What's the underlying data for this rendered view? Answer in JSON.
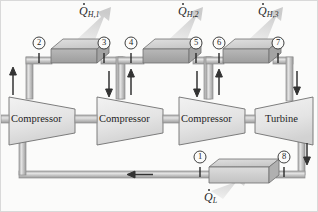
{
  "figure": {
    "background_color": "#fbfbfa",
    "pipe_color": "#b9b9b9",
    "pipe_edge_color": "#8f8f8f",
    "component_fill": "#e9e9e9",
    "component_edge": "#6f6f6f",
    "exchanger_fill": "#b3b3b3",
    "arrow_color": "#3a3a3a",
    "heat_plume_color": "#dcdcdc"
  },
  "heat_labels": [
    {
      "id": "qh1",
      "symbol": "Q",
      "sub": "H,1",
      "dotted": true,
      "x": 78,
      "y": 4
    },
    {
      "id": "qh2",
      "symbol": "Q",
      "sub": "H,2",
      "dotted": true,
      "x": 177,
      "y": 4
    },
    {
      "id": "qh3",
      "symbol": "Q",
      "sub": "H,3",
      "dotted": true,
      "x": 257,
      "y": 4
    },
    {
      "id": "ql",
      "symbol": "Q",
      "sub": "L",
      "dotted": true,
      "x": 203,
      "y": 190
    }
  ],
  "components": [
    {
      "id": "compressor-1",
      "label": "Compressor",
      "type": "compressor",
      "x": 6,
      "y": 94,
      "w": 72,
      "h": 48
    },
    {
      "id": "compressor-2",
      "label": "Compressor",
      "type": "compressor",
      "x": 94,
      "y": 94,
      "w": 72,
      "h": 48
    },
    {
      "id": "compressor-3",
      "label": "Compressor",
      "type": "compressor",
      "x": 176,
      "y": 94,
      "w": 72,
      "h": 48
    },
    {
      "id": "turbine-1",
      "label": "Turbine",
      "type": "turbine",
      "x": 252,
      "y": 94,
      "w": 62,
      "h": 48
    }
  ],
  "heat_exchangers": [
    {
      "id": "intercooler-1",
      "x": 44,
      "y": 38,
      "w": 62,
      "h": 22,
      "direction": "out"
    },
    {
      "id": "intercooler-2",
      "x": 136,
      "y": 38,
      "w": 62,
      "h": 22,
      "direction": "out"
    },
    {
      "id": "aftercooler-3",
      "x": 216,
      "y": 38,
      "w": 62,
      "h": 22,
      "direction": "out"
    },
    {
      "id": "refrigerated-space-heat-exchanger",
      "x": 206,
      "y": 158,
      "w": 72,
      "h": 20,
      "direction": "in"
    }
  ],
  "state_points": [
    {
      "id": "state-2",
      "number": "2",
      "x": 44,
      "y": 32
    },
    {
      "id": "state-3",
      "number": "3",
      "x": 100,
      "y": 32
    },
    {
      "id": "state-4",
      "number": "4",
      "x": 136,
      "y": 32
    },
    {
      "id": "state-5",
      "number": "5",
      "x": 192,
      "y": 32
    },
    {
      "id": "state-6",
      "number": "6",
      "x": 215,
      "y": 32
    },
    {
      "id": "state-7",
      "number": "7",
      "x": 272,
      "y": 32
    },
    {
      "id": "state-1",
      "number": "1",
      "x": 193,
      "y": 150
    },
    {
      "id": "state-8",
      "number": "8",
      "x": 280,
      "y": 150
    }
  ],
  "flow_arrows": [
    {
      "id": "flow-up-left-riser",
      "direction": "up",
      "x": 28,
      "y": 74
    },
    {
      "id": "flow-down-to-compressor-2",
      "direction": "down",
      "x": 120,
      "y": 74
    },
    {
      "id": "flow-up-to-exchanger-2",
      "direction": "up",
      "x": 122,
      "y": 74
    },
    {
      "id": "flow-down-to-compressor-3",
      "direction": "down",
      "x": 208,
      "y": 74
    },
    {
      "id": "flow-up-to-exchanger-3",
      "direction": "up",
      "x": 210,
      "y": 74
    },
    {
      "id": "flow-down-from-turbine",
      "direction": "down",
      "x": 300,
      "y": 152
    },
    {
      "id": "flow-left-return-line",
      "direction": "left",
      "x": 138,
      "y": 176
    }
  ]
}
